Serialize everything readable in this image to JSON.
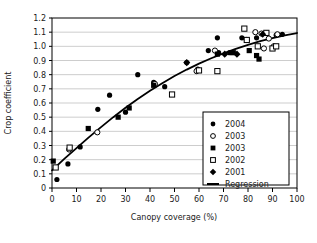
{
  "chart_data": {
    "type": "scatter",
    "title": "",
    "xlabel": "Canopy coverage (%)",
    "ylabel": "Crop coefficient",
    "xlim": [
      0,
      100
    ],
    "ylim": [
      0,
      1.2
    ],
    "xticks": [
      "0",
      "10",
      "20",
      "30",
      "40",
      "50",
      "60",
      "70",
      "80",
      "90",
      "100"
    ],
    "yticks": [
      "0",
      "0.1",
      "0.2",
      "0.3",
      "0.4",
      "0.5",
      "0.6",
      "0.7",
      "0.8",
      "0.9",
      "1.0",
      "1.1",
      "1.2"
    ],
    "grid": "horizontal",
    "legend_position": "lower-right-inside",
    "series": [
      {
        "name": "2004",
        "marker": "filled-circle",
        "color": "#000000",
        "points": [
          [
            2.0,
            0.06
          ],
          [
            6.5,
            0.17
          ],
          [
            11.5,
            0.29
          ],
          [
            18.7,
            0.555
          ],
          [
            23.5,
            0.655
          ],
          [
            30.0,
            0.535
          ],
          [
            35.0,
            0.8
          ],
          [
            41.5,
            0.745
          ],
          [
            46.0,
            0.715
          ],
          [
            55.0,
            0.885
          ],
          [
            59.5,
            0.84
          ],
          [
            63.8,
            0.97
          ],
          [
            67.5,
            1.06
          ],
          [
            68.0,
            0.955
          ],
          [
            72.5,
            0.955
          ],
          [
            77.5,
            1.06
          ],
          [
            83.5,
            1.06
          ],
          [
            87.5,
            1.095
          ],
          [
            91.5,
            1.08
          ],
          [
            94.0,
            1.085
          ]
        ]
      },
      {
        "name": "2003",
        "marker": "open-circle",
        "color": "#000000",
        "points": [
          [
            7.0,
            0.272
          ],
          [
            18.5,
            0.393
          ],
          [
            42.0,
            0.735
          ],
          [
            59.0,
            0.825
          ],
          [
            66.5,
            0.97
          ],
          [
            79.5,
            1.045
          ],
          [
            83.0,
            1.1
          ],
          [
            85.5,
            1.09
          ],
          [
            86.5,
            0.985
          ],
          [
            88.5,
            1.055
          ],
          [
            90.5,
            1.0
          ],
          [
            92.0,
            1.085
          ]
        ]
      },
      {
        "name": "2003",
        "marker": "filled-square",
        "color": "#000000",
        "points": [
          [
            0.5,
            0.19
          ],
          [
            14.8,
            0.42
          ],
          [
            27.0,
            0.5
          ],
          [
            31.5,
            0.565
          ],
          [
            41.5,
            0.725
          ],
          [
            67.5,
            0.945
          ],
          [
            74.0,
            0.955
          ],
          [
            80.5,
            0.97
          ],
          [
            83.5,
            0.935
          ],
          [
            84.5,
            0.91
          ]
        ]
      },
      {
        "name": "2002",
        "marker": "open-square",
        "color": "#000000",
        "points": [
          [
            1.5,
            0.145
          ],
          [
            7.2,
            0.285
          ],
          [
            49.0,
            0.66
          ],
          [
            60.0,
            0.83
          ],
          [
            67.5,
            0.825
          ],
          [
            78.5,
            1.125
          ],
          [
            79.5,
            1.045
          ],
          [
            84.0,
            1.0
          ],
          [
            87.5,
            1.095
          ],
          [
            90.0,
            0.985
          ],
          [
            91.5,
            1.0
          ]
        ]
      },
      {
        "name": "2001",
        "marker": "filled-diamond",
        "color": "#000000",
        "points": [
          [
            55.0,
            0.885
          ],
          [
            70.5,
            0.945
          ],
          [
            75.5,
            0.945
          ],
          [
            86.0,
            1.085
          ]
        ]
      }
    ],
    "regression": {
      "name": "Regression",
      "color": "#000000",
      "points": [
        [
          0.0,
          0.125
        ],
        [
          5.0,
          0.205
        ],
        [
          10.0,
          0.282
        ],
        [
          15.0,
          0.357
        ],
        [
          20.0,
          0.43
        ],
        [
          25.0,
          0.5
        ],
        [
          30.0,
          0.566
        ],
        [
          35.0,
          0.628
        ],
        [
          40.0,
          0.686
        ],
        [
          45.0,
          0.74
        ],
        [
          50.0,
          0.79
        ],
        [
          55.0,
          0.836
        ],
        [
          60.0,
          0.878
        ],
        [
          65.0,
          0.916
        ],
        [
          70.0,
          0.95
        ],
        [
          75.0,
          0.982
        ],
        [
          80.0,
          1.01
        ],
        [
          85.0,
          1.036
        ],
        [
          90.0,
          1.058
        ],
        [
          95.0,
          1.078
        ],
        [
          100.0,
          1.094
        ]
      ]
    },
    "legend_entries": [
      {
        "label": "2004",
        "marker": "filled-circle"
      },
      {
        "label": "2003",
        "marker": "open-circle"
      },
      {
        "label": "2003",
        "marker": "filled-square"
      },
      {
        "label": "2002",
        "marker": "open-square"
      },
      {
        "label": "2001",
        "marker": "filled-diamond"
      },
      {
        "label": "Regression",
        "marker": "line"
      }
    ]
  }
}
